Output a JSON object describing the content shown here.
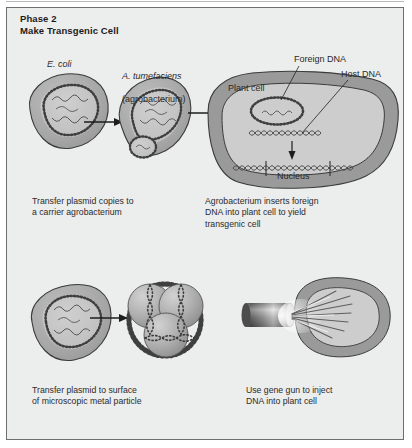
{
  "figure": {
    "title_line1": "Phase 2",
    "title_line2": "Make Transgenic Cell",
    "background": "#eceded",
    "frame_border": "#6e6e6e"
  },
  "colors": {
    "cell_body": "#a8a8a8",
    "cell_interior": "#c4c4c4",
    "plant_wall": "#9a9a9a",
    "plant_interior": "#cdcdcd",
    "outline": "#3b3b3b",
    "dna": "#4a4a4a",
    "text": "#2a2a2a"
  },
  "top_panel": {
    "ecoli_label": "E. coli",
    "agrobacterium_label_italic": "A. tumefaciens",
    "agrobacterium_label_plain": "(agrobacterium)",
    "plant_cell_label": "Plant cell",
    "nucleus_label": "Nucleus",
    "foreign_dna_label": "Foreign DNA",
    "host_dna_label": "Host DNA",
    "caption_left": "Transfer plasmid copies to\na carrier agrobacterium",
    "caption_right": "Agrobacterium inserts foreign\nDNA into plant cell to yield\ntransgenic cell"
  },
  "bottom_panel": {
    "caption_left": "Transfer plasmid to surface\nof microscopic metal particle",
    "caption_right": "Use gene gun to inject\nDNA into plant cell"
  }
}
